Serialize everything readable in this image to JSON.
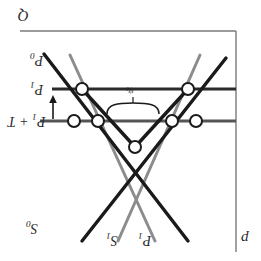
{
  "figure": {
    "name": "energy-dispersion-diagram",
    "orientation": "rotated-180",
    "width": 261,
    "height": 261,
    "background": "#ffffff"
  },
  "axes": {
    "vertical_axis_label": "Q",
    "horizontal_axis_label": "p",
    "frame_color": "#7a7a7a",
    "top_rule_y": 31,
    "right_rule_x": 236
  },
  "levels": [
    {
      "id": "p0",
      "label_html": "P<sub>0</sub>",
      "label_text": "P0",
      "y": 60,
      "has_line": false
    },
    {
      "id": "p1",
      "label_html": "P<sub>1</sub>",
      "label_text": "P1",
      "y": 89,
      "has_line": true
    },
    {
      "id": "p1t",
      "label_html": "P<sub>1</sub> + T",
      "label_text": "P1 + T",
      "y": 121,
      "has_line": true
    }
  ],
  "branch_labels": [
    {
      "id": "s0",
      "label_html": "S<sub>0</sub>",
      "label_text": "S0",
      "x": 30,
      "y": 228
    },
    {
      "id": "s1",
      "label_html": "S<sub>1</sub>",
      "label_text": "S1",
      "x": 112,
      "y": 240
    },
    {
      "id": "p1b",
      "label_html": "P<sub>1</sub>",
      "label_text": "P1",
      "x": 143,
      "y": 240
    }
  ],
  "annotation": {
    "id": "gap-brace",
    "label_html": "&psi;<sub>0</sub>",
    "label_text": "psi-0",
    "x": 134,
    "y": 93,
    "brace_left_x": 107,
    "brace_right_x": 163,
    "brace_y": 107
  },
  "arrow": {
    "id": "transition-arrow",
    "x": 53,
    "y_start": 118,
    "y_end": 95,
    "direction": "up",
    "color": "#1a1a1a"
  },
  "colors": {
    "black_branch": "#1a1a1a",
    "gray_branch": "#8c8c8c",
    "level_line": "#2b2b2b",
    "frame": "#7a7a7a",
    "node_fill": "#ffffff",
    "node_stroke": "#1a1a1a",
    "text": "#2a2a2a"
  },
  "nodes": [
    {
      "id": "n-left-upper",
      "x": 82,
      "y": 89,
      "r": 6
    },
    {
      "id": "n-right-upper",
      "x": 188,
      "y": 89,
      "r": 6
    },
    {
      "id": "n-left-a",
      "x": 74,
      "y": 121,
      "r": 6
    },
    {
      "id": "n-left-b",
      "x": 98,
      "y": 121,
      "r": 6
    },
    {
      "id": "n-right-a",
      "x": 172,
      "y": 121,
      "r": 6
    },
    {
      "id": "n-right-b",
      "x": 196,
      "y": 121,
      "r": 6
    },
    {
      "id": "n-center",
      "x": 135,
      "y": 147,
      "r": 6
    }
  ],
  "branches": [
    {
      "id": "black-up-left",
      "color": "black",
      "points": "44,54 188,241"
    },
    {
      "id": "black-up-right",
      "color": "black",
      "points": "226,58 82,241"
    },
    {
      "id": "black-v-left",
      "color": "black",
      "points": "82,89 135,147"
    },
    {
      "id": "black-v-right",
      "color": "black",
      "points": "188,89 135,147"
    },
    {
      "id": "gray-left",
      "color": "gray",
      "points": "70,55 155,241"
    },
    {
      "id": "gray-right",
      "color": "gray",
      "points": "200,55 118,241"
    }
  ]
}
